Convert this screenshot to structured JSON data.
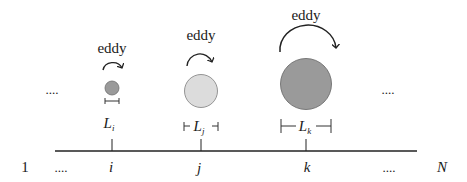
{
  "diagram": {
    "eddies": [
      {
        "id": "i",
        "label_word": "eddy",
        "length_symbol": "L",
        "length_sub": "i",
        "fill": "#9a9a9a",
        "stroke": "#6e6e6e",
        "size": "small"
      },
      {
        "id": "j",
        "label_word": "eddy",
        "length_symbol": "L",
        "length_sub": "j",
        "fill": "#dcdcdc",
        "stroke": "#8a8a8a",
        "size": "medium"
      },
      {
        "id": "k",
        "label_word": "eddy",
        "length_symbol": "L",
        "length_sub": "k",
        "fill": "#9a9a9a",
        "stroke": "#6e6e6e",
        "size": "large"
      }
    ],
    "ellipsis_row": {
      "left": "....",
      "right": "...."
    },
    "axis": {
      "start_label": "1",
      "left_ellipsis": "....",
      "ticks": [
        "i",
        "j",
        "k"
      ],
      "right_ellipsis": "....",
      "end_label": "N"
    }
  }
}
